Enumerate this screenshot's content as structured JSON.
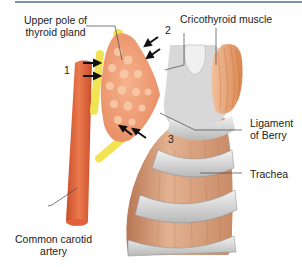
{
  "figure": {
    "top_rule_color": "#7d93ad",
    "labels": {
      "upper_pole_line1": "Upper pole of",
      "upper_pole_line2": "thyroid gland",
      "cricothyroid": "Cricothyroid muscle",
      "ligament_line1": "Ligament",
      "ligament_line2": "of Berry",
      "trachea": "Trachea",
      "carotid_line1": "Common carotid",
      "carotid_line2": "artery"
    },
    "numbers": {
      "n1": "1",
      "n2": "2",
      "n3": "3"
    },
    "colors": {
      "thyroid": "#f0a27a",
      "thyroid_nodule": "#f7c4a2",
      "carotid": "#e0643a",
      "highlight": "#f2e24a",
      "trachea": "#d9a07e",
      "cartilage_ring": "#d5d5d5",
      "muscle": "#e9a070"
    }
  }
}
